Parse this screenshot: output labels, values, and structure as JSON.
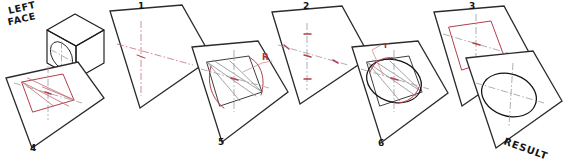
{
  "figure": {
    "colors": {
      "outline": "#1b1b1b",
      "plane_edge": "#2a2a2a",
      "construction_red": "#c4707a",
      "construction_red_strong": "#b33f4c",
      "centerline_gray": "#9a9aa0",
      "final_curve": "#111111",
      "background": "#ffffff"
    }
  },
  "labels": {
    "left_face_line1": "LEFT",
    "left_face_line2": "FACE",
    "step1": "1",
    "step2": "2",
    "step3": "3",
    "step4": "4",
    "step5": "5",
    "step6": "6",
    "radius_large": "R",
    "radius_small": "r",
    "result": "RESULT"
  },
  "panels": [
    {
      "id": "cube",
      "name": "isometric-cube-with-circle",
      "label": "LEFT FACE",
      "caption": "",
      "description": "Isometric cube with a circle drawn on the left face, centerlines shown"
    },
    {
      "id": "step1",
      "name": "panel-step-1",
      "label": "1",
      "caption": "1",
      "description": "Isometric plane (rhombus) with red isometric centerlines through the center"
    },
    {
      "id": "step2",
      "name": "panel-step-2",
      "label": "2",
      "caption": "2",
      "description": "Four tangent points marked on the centerlines at the circle radius"
    },
    {
      "id": "step3",
      "name": "panel-step-3",
      "label": "3",
      "caption": "3",
      "description": "Enclosing isometric square (rhombus) drawn through the four tangent points"
    },
    {
      "id": "step4",
      "name": "panel-step-4",
      "label": "4",
      "caption": "4",
      "description": "Perpendicular bisectors drawn from the obtuse corners to the opposite midpoints, locating the four centers"
    },
    {
      "id": "step5",
      "name": "panel-step-5",
      "label": "5",
      "caption": "5",
      "annotation": "R",
      "description": "Large radius R arcs swung from the obtuse corners"
    },
    {
      "id": "step6",
      "name": "panel-step-6",
      "label": "6",
      "caption": "6",
      "annotation": "r",
      "description": "Small radius r arcs swung from the two interior centers, completing the ellipse"
    },
    {
      "id": "result",
      "name": "panel-result",
      "label": "RESULT",
      "caption": "RESULT",
      "description": "Finished isometric circle (ellipse) on the isometric plane with centerlines"
    }
  ]
}
